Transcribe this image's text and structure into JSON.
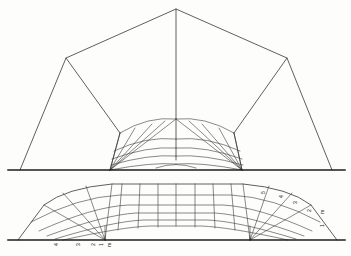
{
  "figure": {
    "panels": [
      {
        "name": "upper-elevation",
        "description": "Elevation with polygonal outline and radial fan ribs"
      },
      {
        "name": "lower-development",
        "description": "Developed surface with curvilinear rib grid and numbered ribs"
      }
    ],
    "line_color": "#2b2b2b",
    "background_color": "#fdfdfc"
  },
  "labels": {
    "left_group": [
      {
        "id": "L4",
        "text": "4",
        "x": 58,
        "y": 245
      },
      {
        "id": "L3",
        "text": "3",
        "x": 80,
        "y": 245
      },
      {
        "id": "L2",
        "text": "2",
        "x": 95,
        "y": 245
      },
      {
        "id": "L1",
        "text": "1",
        "x": 104,
        "y": 245
      },
      {
        "id": "Lm",
        "text": "m",
        "x": 111,
        "y": 244
      }
    ],
    "right_group": [
      {
        "id": "R5",
        "text": "5",
        "x": 264,
        "y": 192
      },
      {
        "id": "R4",
        "text": "4",
        "x": 282,
        "y": 196
      },
      {
        "id": "R3",
        "text": "3",
        "x": 296,
        "y": 202
      },
      {
        "id": "R2",
        "text": "2",
        "x": 310,
        "y": 210
      },
      {
        "id": "Rm",
        "text": "m",
        "x": 322,
        "y": 212
      },
      {
        "id": "R1",
        "text": "1",
        "x": 322,
        "y": 224
      }
    ]
  },
  "geometry": {
    "upper": {
      "apex": {
        "x": 176,
        "y": 9
      },
      "left_shoulder": {
        "x": 66,
        "y": 58
      },
      "right_shoulder": {
        "x": 287,
        "y": 58
      },
      "left_base": {
        "x": 20,
        "y": 170
      },
      "right_base": {
        "x": 332,
        "y": 170
      },
      "fan_center_left": {
        "x": 120,
        "y": 133
      },
      "fan_center_right": {
        "x": 234,
        "y": 133
      },
      "springer_left": {
        "x": 110,
        "y": 170
      },
      "springer_right": {
        "x": 242,
        "y": 170
      },
      "baseline_y": 170,
      "rib_count": 5
    },
    "lower": {
      "baseline_y": 240,
      "left_end": {
        "x": 18,
        "y": 240
      },
      "right_end": {
        "x": 337,
        "y": 240
      },
      "crown_left": {
        "x": 150,
        "y": 185
      },
      "crown_right": {
        "x": 205,
        "y": 185
      },
      "rib_count": 5,
      "course_count": 5
    }
  }
}
